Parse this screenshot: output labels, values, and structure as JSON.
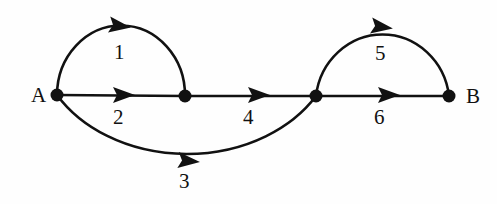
{
  "diagram": {
    "type": "directed-graph",
    "canvas": {
      "width": 497,
      "height": 204
    },
    "colors": {
      "background": "#fefefe",
      "stroke": "#111111",
      "label": "#111111"
    },
    "nodes": [
      {
        "id": "A",
        "label": "A",
        "x": 57,
        "y": 95,
        "radius": 6.5,
        "label_x": 31,
        "label_y": 85,
        "labeled": true
      },
      {
        "id": "n2",
        "label": "",
        "x": 185,
        "y": 96,
        "radius": 6.5,
        "labeled": false
      },
      {
        "id": "n3",
        "label": "",
        "x": 316,
        "y": 96,
        "radius": 6.5,
        "labeled": false
      },
      {
        "id": "B",
        "label": "B",
        "x": 449,
        "y": 96,
        "radius": 6.5,
        "label_x": 466,
        "label_y": 86,
        "labeled": true
      }
    ],
    "edges": [
      {
        "id": "edge-1",
        "label": "1",
        "from": "A",
        "to": "n2",
        "shape": "arc-up",
        "path": "M 57 95 A 64 70 0 0 1 185 96",
        "arrow": {
          "x": 120,
          "y": 26,
          "angle": 8
        },
        "label_x": 114,
        "label_y": 42
      },
      {
        "id": "edge-2",
        "label": "2",
        "from": "A",
        "to": "n2",
        "shape": "straight",
        "path": "M 57 95 L 185 96",
        "arrow": {
          "x": 124,
          "y": 95,
          "angle": 0
        },
        "label_x": 113,
        "label_y": 107
      },
      {
        "id": "edge-3",
        "label": "3",
        "from": "A",
        "to": "n3",
        "shape": "arc-down",
        "path": "M 57 95 A 150 118 0 0 0 316 96",
        "arrow": {
          "x": 189,
          "y": 161,
          "angle": 5
        },
        "label_x": 179,
        "label_y": 171
      },
      {
        "id": "edge-4",
        "label": "4",
        "from": "n2",
        "to": "n3",
        "shape": "straight",
        "path": "M 185 96 L 316 96",
        "arrow": {
          "x": 259,
          "y": 95,
          "angle": 0
        },
        "label_x": 243,
        "label_y": 107
      },
      {
        "id": "edge-5",
        "label": "5",
        "from": "n3",
        "to": "B",
        "shape": "arc-up",
        "path": "M 316 96 A 67 70 0 0 1 449 96",
        "arrow": {
          "x": 382,
          "y": 27,
          "angle": 8
        },
        "label_x": 375,
        "label_y": 43
      },
      {
        "id": "edge-6",
        "label": "6",
        "from": "n3",
        "to": "B",
        "shape": "straight",
        "path": "M 316 96 L 449 96",
        "arrow": {
          "x": 389,
          "y": 95,
          "angle": 0
        },
        "label_x": 374,
        "label_y": 107
      }
    ]
  }
}
